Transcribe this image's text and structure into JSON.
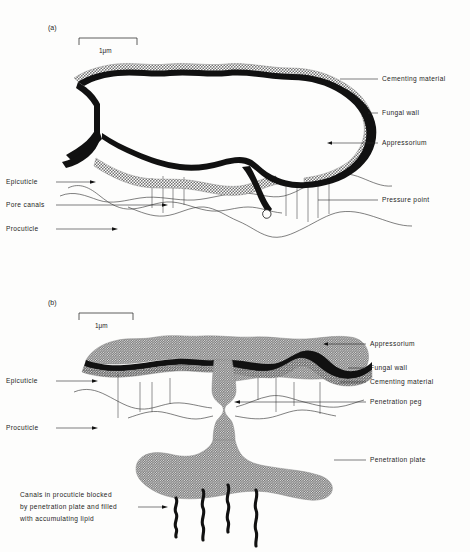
{
  "figure": {
    "background_color": "#fdfdfc",
    "ink_color": "#1d1d1d",
    "wall_color": "#111111",
    "cement_color": "#9a9a9a",
    "body_color": "#a9a9a9"
  },
  "panel_a": {
    "panel_label": "(a)",
    "scale_bar": {
      "label": "1μm"
    },
    "labels_right": [
      {
        "text": "Cementing  material"
      },
      {
        "text": "Fungal  wall"
      },
      {
        "text": "Appressorium"
      },
      {
        "text": "Pressure  point"
      }
    ],
    "labels_left": [
      {
        "text": "Epicuticle"
      },
      {
        "text": "Pore canals"
      },
      {
        "text": "Procuticle"
      }
    ]
  },
  "panel_b": {
    "panel_label": "(b)",
    "scale_bar": {
      "label": "1μm"
    },
    "labels_right": [
      {
        "text": "Appressorium"
      },
      {
        "text": "Fungal wall"
      },
      {
        "text": "Cementing material"
      },
      {
        "text": "Penetration peg"
      },
      {
        "text": "Penetration plate"
      }
    ],
    "labels_left": [
      {
        "text": "Epicuticle"
      },
      {
        "text": "Procuticle"
      }
    ],
    "caption_lines": [
      "Canals in procuticle blocked",
      "by penetration plate and filled",
      "with accumulating lipid"
    ]
  }
}
